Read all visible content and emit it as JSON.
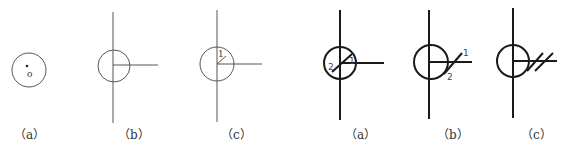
{
  "figures": {
    "left_group": {
      "a": {
        "label": "（a）",
        "point_label": "o"
      },
      "b": {
        "label": "（b）"
      },
      "c": {
        "label": "（c）",
        "marker_1": "1"
      }
    },
    "right_group": {
      "a": {
        "label": "（a）",
        "marker_1": "1",
        "marker_2": "2"
      },
      "b": {
        "label": "（b）",
        "marker_1": "1",
        "marker_2": "2"
      },
      "c": {
        "label": "（c）"
      }
    }
  },
  "colors": {
    "thin_stroke": "#555555",
    "thick_stroke": "#1a1a1a",
    "background": "#ffffff"
  }
}
